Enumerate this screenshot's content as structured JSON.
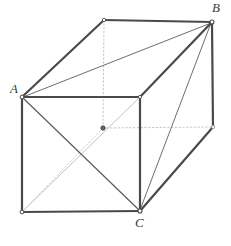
{
  "figure": {
    "name": "rectangular-prism-with-diagonals",
    "type": "geometry-diagram",
    "background_color": "#ffffff",
    "canvas": {
      "width": 231,
      "height": 246
    },
    "labels": {
      "A": "A",
      "B": "B",
      "C": "C"
    },
    "label_positions": {
      "A": {
        "x": 10,
        "y": 82
      },
      "B": {
        "x": 212,
        "y": 1
      },
      "C": {
        "x": 135,
        "y": 216
      }
    },
    "colors": {
      "edge_solid": "#4a4a4a",
      "edge_thin": "#6e6e6e",
      "diagonal_light": "#b9b9b9",
      "hidden_dotted": "#c0c0c0",
      "vertex_fill": "#ffffff",
      "vertex_stroke": "#4a4a4a",
      "center_dot": "#4a4a4a",
      "label_color": "#3a3a3a"
    },
    "stroke_widths": {
      "edge_solid": 2.2,
      "edge_thin": 1.0,
      "diagonal_light": 1.0,
      "hidden_dotted": 1.0
    },
    "vertices": {
      "front_top_left": {
        "x": 22,
        "y": 97,
        "label": "A"
      },
      "front_top_right": {
        "x": 140,
        "y": 97
      },
      "front_bottom_left": {
        "x": 22,
        "y": 212
      },
      "front_bottom_right": {
        "x": 140,
        "y": 211,
        "label": "C"
      },
      "back_top_left": {
        "x": 104,
        "y": 20
      },
      "back_top_right": {
        "x": 212,
        "y": 22,
        "label": "B"
      },
      "back_bottom_right": {
        "x": 213,
        "y": 127
      },
      "center": {
        "x": 103,
        "y": 128
      }
    },
    "edges_solid": [
      {
        "name": "front-top-edge",
        "from": "front_top_left",
        "to": "front_top_right"
      },
      {
        "name": "front-left-edge",
        "from": "front_top_left",
        "to": "front_bottom_left"
      },
      {
        "name": "front-bottom-edge",
        "from": "front_bottom_left",
        "to": "front_bottom_right"
      },
      {
        "name": "front-right-edge",
        "from": "front_top_right",
        "to": "front_bottom_right"
      },
      {
        "name": "top-left-slant-edge",
        "from": "front_top_left",
        "to": "back_top_left"
      },
      {
        "name": "back-top-edge",
        "from": "back_top_left",
        "to": "back_top_right"
      },
      {
        "name": "top-right-slant-edge",
        "from": "front_top_right",
        "to": "back_top_right"
      },
      {
        "name": "back-right-vertical-edge",
        "from": "back_top_right",
        "to": "back_bottom_right"
      },
      {
        "name": "bottom-right-slant-edge",
        "from": "front_bottom_right",
        "to": "back_bottom_right"
      }
    ],
    "diagonals_thin": [
      {
        "name": "diagonal-A-to-B",
        "from": "front_top_left",
        "to": "back_top_right"
      },
      {
        "name": "diagonal-C-to-B",
        "from": "front_bottom_right",
        "to": "back_top_right"
      },
      {
        "name": "diagonal-A-to-C",
        "from": "front_top_left",
        "to": "front_bottom_right"
      }
    ],
    "diagonals_light": [
      {
        "name": "diagonal-front-bottom-left-to-front-top-right",
        "from": "front_bottom_left",
        "to": "front_top_right"
      }
    ],
    "hidden_dotted_lines": [
      {
        "name": "dotted-vertical-back-top-left-to-center",
        "from": "back_top_left",
        "to": "center"
      },
      {
        "name": "dotted-horizontal-center-to-back-bottom-right",
        "from": "center",
        "to": "back_bottom_right"
      },
      {
        "name": "dotted-center-to-front-bottom-left",
        "from": "center",
        "to": "front_bottom_left"
      }
    ]
  }
}
